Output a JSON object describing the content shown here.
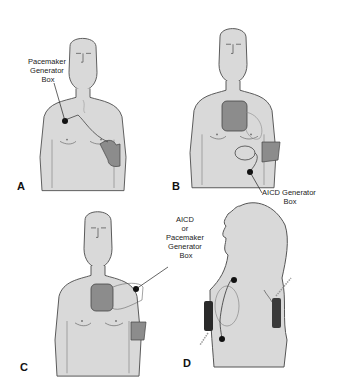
{
  "figure": {
    "panels": [
      {
        "letter": "A",
        "callout": [
          "Pacemaker",
          "Generator",
          "Box"
        ]
      },
      {
        "letter": "B",
        "callout": [
          "AICD Generator",
          "Box"
        ]
      },
      {
        "letter": "C",
        "callout": [
          "AICD",
          "or",
          "Pacemaker",
          "Generator",
          "Box"
        ]
      },
      {
        "letter": "D",
        "callout": []
      }
    ]
  },
  "colors": {
    "skin": "#d9d9d9",
    "outline": "#555555",
    "pad": "#8c8c8c",
    "pad_dark": "#2a2a2a",
    "device": "#111111",
    "background": "#ffffff"
  }
}
